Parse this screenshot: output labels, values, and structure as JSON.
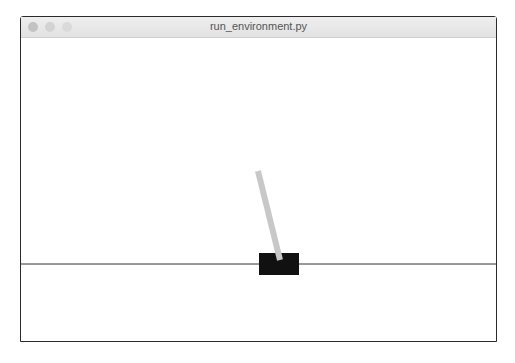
{
  "window": {
    "title": "run_environment.py",
    "traffic_lights": [
      "close-button",
      "minimize-button",
      "zoom-button"
    ]
  },
  "scene": {
    "track": {
      "y": 226,
      "color": "#333333"
    },
    "cart": {
      "x": 238,
      "y": 215,
      "width": 40,
      "height": 22,
      "color": "#111111"
    },
    "pole": {
      "x1": 237,
      "y1": 133,
      "x2": 259,
      "y2": 222,
      "width": 6,
      "color": "#c8c8c8"
    },
    "background": "#ffffff"
  }
}
